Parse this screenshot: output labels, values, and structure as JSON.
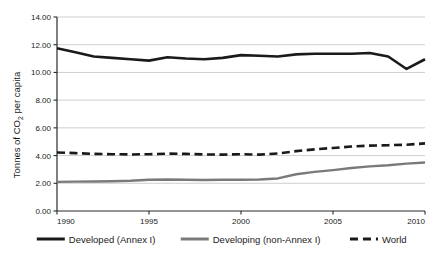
{
  "chart_data": {
    "type": "line",
    "title": "",
    "subtitle": "",
    "xlabel": "",
    "ylabel": "Tonnes of CO₂ per capita",
    "ylabel_parts": {
      "prefix": "Tonnes of CO",
      "subscript": "2",
      "suffix": " per capita"
    },
    "x": [
      1990,
      1991,
      1992,
      1993,
      1994,
      1995,
      1996,
      1997,
      1998,
      1999,
      2000,
      2001,
      2002,
      2003,
      2004,
      2005,
      2006,
      2007,
      2008,
      2009,
      2010
    ],
    "xlim": [
      1990,
      2010
    ],
    "ylim": [
      0.0,
      14.0
    ],
    "ytick_values": [
      0.0,
      2.0,
      4.0,
      6.0,
      8.0,
      10.0,
      12.0,
      14.0
    ],
    "ytick_labels": [
      "0.00",
      "2.00",
      "4.00",
      "6.00",
      "8.00",
      "10.00",
      "12.00",
      "14.00"
    ],
    "xtick_values": [
      1990,
      1995,
      2000,
      2005,
      2010
    ],
    "xtick_labels": [
      "1990",
      "1995",
      "2000",
      "2005",
      "2010"
    ],
    "grid": "horizontal",
    "legend_position": "bottom",
    "series": [
      {
        "name": "Developed (Annex I)",
        "color": "#1a1a1a",
        "style": "solid",
        "width": 2.6,
        "values": [
          11.75,
          11.45,
          11.15,
          11.05,
          10.95,
          10.85,
          11.1,
          11.0,
          10.95,
          11.05,
          11.25,
          11.2,
          11.15,
          11.3,
          11.35,
          11.35,
          11.35,
          11.4,
          11.15,
          10.25,
          10.95
        ]
      },
      {
        "name": "Developing (non-Annex I)",
        "color": "#7a7a7a",
        "style": "solid",
        "width": 2.4,
        "values": [
          2.1,
          2.12,
          2.13,
          2.15,
          2.18,
          2.25,
          2.27,
          2.26,
          2.24,
          2.25,
          2.26,
          2.27,
          2.35,
          2.65,
          2.82,
          2.95,
          3.1,
          3.22,
          3.3,
          3.42,
          3.5
        ]
      },
      {
        "name": "World",
        "color": "#1a1a1a",
        "style": "dashed",
        "width": 2.6,
        "values": [
          4.22,
          4.18,
          4.12,
          4.1,
          4.08,
          4.1,
          4.14,
          4.12,
          4.08,
          4.07,
          4.1,
          4.07,
          4.15,
          4.32,
          4.45,
          4.55,
          4.65,
          4.72,
          4.75,
          4.78,
          4.88
        ]
      }
    ]
  },
  "legend": {
    "items": [
      {
        "label": "Developed (Annex I)",
        "color": "#1a1a1a",
        "style": "solid"
      },
      {
        "label": "Developing (non-Annex I)",
        "color": "#7a7a7a",
        "style": "solid"
      },
      {
        "label": "World",
        "color": "#1a1a1a",
        "style": "dashed"
      }
    ]
  },
  "colors": {
    "background": "#ffffff",
    "axis": "#2b2b2b",
    "grid": "#c9c9c9",
    "text": "#1a1a1a",
    "developed": "#1a1a1a",
    "developing": "#7a7a7a",
    "world": "#1a1a1a"
  }
}
